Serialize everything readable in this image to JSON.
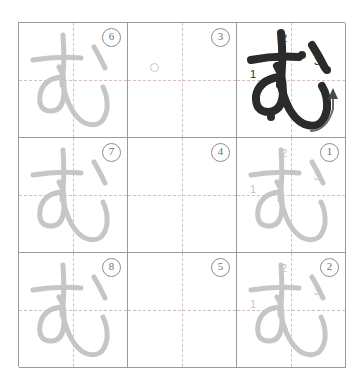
{
  "worksheet": {
    "character": "む",
    "title": "Hiragana mu stroke-order practice grid",
    "grid": {
      "rows": 3,
      "columns": 3
    },
    "colors": {
      "grid_line": "#9a9a9a",
      "guide_line": "#d2b4b4",
      "trace_stroke": "#c6c6c6",
      "model_stroke": "#2b2b2b",
      "sequence_number": "#6f6f6f",
      "stroke_number_light": "#c3c3c3",
      "stroke_number_dark": "#2b2b2b",
      "page_background": "#ffffff"
    },
    "stroke_numbers": [
      "1",
      "2",
      "3"
    ],
    "cells": [
      {
        "id": "cell-r1c1",
        "row": 1,
        "column": 1,
        "sequence_label": "6",
        "glyph_style": "trace",
        "has_stroke_numbers": false,
        "has_arrow": false,
        "has_circle_marker": false
      },
      {
        "id": "cell-r1c2",
        "row": 1,
        "column": 2,
        "sequence_label": "3",
        "glyph_style": "empty",
        "has_stroke_numbers": false,
        "has_arrow": false,
        "has_circle_marker": true
      },
      {
        "id": "cell-r1c3",
        "row": 1,
        "column": 3,
        "sequence_label": "",
        "glyph_style": "model",
        "has_stroke_numbers": true,
        "has_arrow": true,
        "has_circle_marker": false
      },
      {
        "id": "cell-r2c1",
        "row": 2,
        "column": 1,
        "sequence_label": "7",
        "glyph_style": "trace",
        "has_stroke_numbers": false,
        "has_arrow": false,
        "has_circle_marker": false
      },
      {
        "id": "cell-r2c2",
        "row": 2,
        "column": 2,
        "sequence_label": "4",
        "glyph_style": "empty",
        "has_stroke_numbers": false,
        "has_arrow": false,
        "has_circle_marker": false
      },
      {
        "id": "cell-r2c3",
        "row": 2,
        "column": 3,
        "sequence_label": "1",
        "glyph_style": "trace",
        "has_stroke_numbers": true,
        "has_arrow": false,
        "has_circle_marker": false
      },
      {
        "id": "cell-r3c1",
        "row": 3,
        "column": 1,
        "sequence_label": "8",
        "glyph_style": "trace",
        "has_stroke_numbers": false,
        "has_arrow": false,
        "has_circle_marker": false
      },
      {
        "id": "cell-r3c2",
        "row": 3,
        "column": 2,
        "sequence_label": "5",
        "glyph_style": "empty",
        "has_stroke_numbers": false,
        "has_arrow": false,
        "has_circle_marker": false
      },
      {
        "id": "cell-r3c3",
        "row": 3,
        "column": 3,
        "sequence_label": "2",
        "glyph_style": "trace",
        "has_stroke_numbers": true,
        "has_arrow": false,
        "has_circle_marker": false
      }
    ]
  }
}
